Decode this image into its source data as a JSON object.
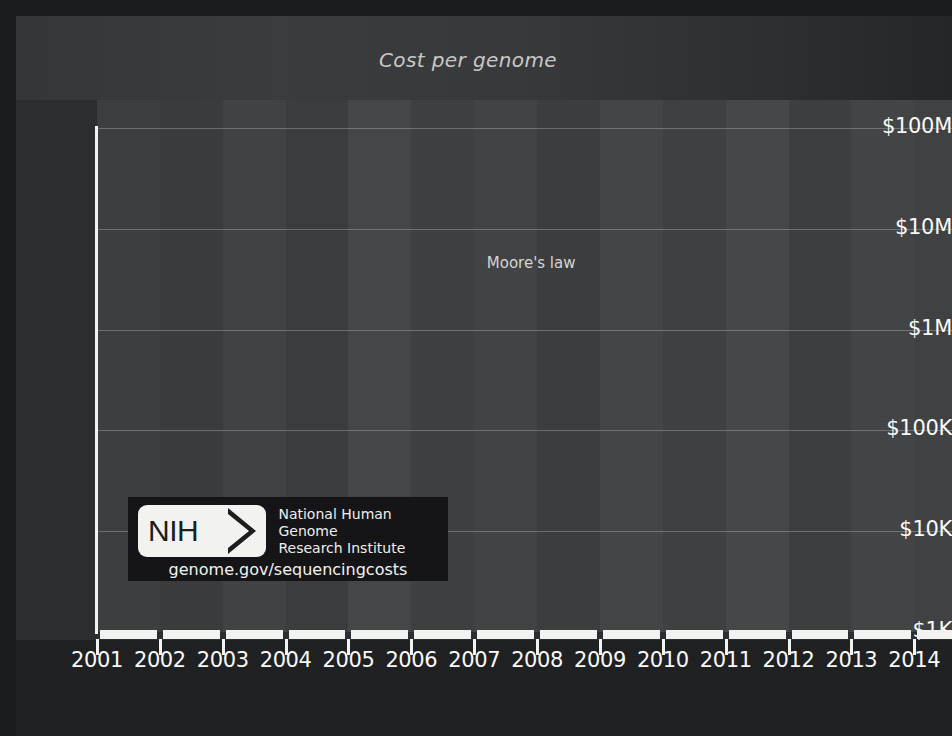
{
  "title": "Cost per genome",
  "annotations": {
    "moore": "Moore's law"
  },
  "logo": {
    "mark": "NIH",
    "org_line1": "National Human Genome",
    "org_line2": "Research Institute",
    "url": "genome.gov/sequencingcosts",
    "chevron_icon": "nih-chevron-icon"
  },
  "colors": {
    "background": "#2b2c2e",
    "plot_background": "#3a3b3c",
    "axis": "#f4f4f2",
    "grid": "#e1e1dc",
    "series": "#141416",
    "series_outline": "#d8d8d4",
    "moore_line": "#fbfbf9",
    "title_text": "#c9c9c7",
    "logo_background": "#131315"
  },
  "chart_data": {
    "type": "line",
    "title": "Cost per genome",
    "xlabel": "",
    "ylabel": "",
    "grid": true,
    "legend": "none",
    "yscale": "log",
    "ylim": [
      1000,
      100000000
    ],
    "xlim": [
      2001.0,
      2014.6
    ],
    "ytick_labels": [
      "$100M",
      "$10M",
      "$1M",
      "$100K",
      "$10K",
      "$1K"
    ],
    "ytick_values": [
      100000000,
      10000000,
      1000000,
      100000,
      10000,
      1000
    ],
    "xtick_labels": [
      "2001",
      "2002",
      "2003",
      "2004",
      "2005",
      "2006",
      "2007",
      "2008",
      "2009",
      "2010",
      "2011",
      "2012",
      "2013",
      "2014"
    ],
    "xtick_values": [
      2001,
      2002,
      2003,
      2004,
      2005,
      2006,
      2007,
      2008,
      2009,
      2010,
      2011,
      2012,
      2013,
      2014
    ],
    "series": [
      {
        "name": "Cost per genome",
        "marker": "diamond",
        "x": [
          2001.75,
          2002.25,
          2002.75,
          2003.25,
          2003.75,
          2004.0,
          2004.25,
          2004.5,
          2004.75,
          2005.0,
          2005.25,
          2005.5,
          2005.75,
          2006.0,
          2006.25,
          2006.5,
          2006.75,
          2007.0,
          2007.25,
          2007.5,
          2007.75,
          2008.0,
          2008.25,
          2008.5,
          2008.75,
          2009.0,
          2009.25,
          2009.5,
          2009.75,
          2010.0,
          2010.25,
          2010.5,
          2010.75,
          2011.0,
          2011.25,
          2011.5,
          2011.75,
          2012.0,
          2012.25,
          2012.5,
          2012.75,
          2013.0,
          2013.25,
          2013.5,
          2013.75,
          2014.0,
          2014.25
        ],
        "y": [
          95263072,
          70175437,
          61448422,
          53751684,
          40157554,
          28780376,
          20963171,
          18519312,
          16712371,
          15466601,
          13801124,
          12150069,
          10474556,
          10014721,
          9408739,
          8927342,
          8050000,
          7147571,
          4008677,
          3063820,
          1352982,
          752080,
          342502,
          232735,
          154714,
          108065,
          70333,
          57720,
          47050,
          31512,
          31125,
          29092,
          23652,
          16712,
          10497,
          7743,
          7666,
          7950,
          5826,
          5550,
          5096,
          5671,
          5826,
          4920,
          4905,
          4008,
          4200
        ]
      },
      {
        "name": "Moore's law",
        "marker": "none",
        "x": [
          2001.75,
          2014.6
        ],
        "y": [
          100000000,
          1250000
        ]
      }
    ]
  }
}
